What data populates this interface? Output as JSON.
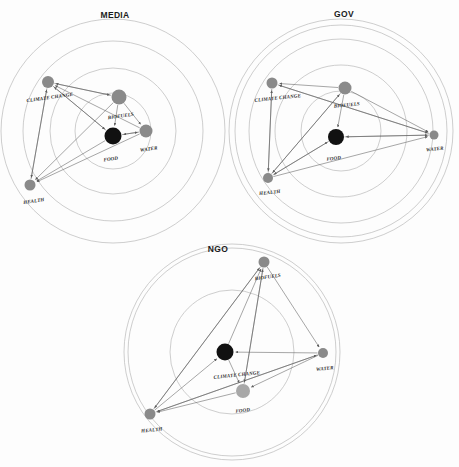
{
  "figure": {
    "background_color": "#fdfdfd",
    "node_color": "#8a8a8a",
    "node_highlight_color": "#111111",
    "ring_color": "#b9b9b9",
    "edge_color": "#5d5d5d"
  },
  "panels": [
    {
      "id": "media",
      "title": "MEDIA",
      "title_xy": [
        115,
        18
      ],
      "center": [
        113,
        131
      ],
      "rings": [
        38,
        63,
        90,
        112
      ],
      "nodes": [
        {
          "name": "climate-change",
          "label": "CLIMATE CHANGE",
          "x": 48,
          "y": 82,
          "r": 6.0,
          "color": "#8a8a8a",
          "label_dx": 2,
          "label_dy": 11,
          "label_anchor": "middle",
          "label_rot": -8
        },
        {
          "name": "biofuels",
          "label": "BIOFUELS",
          "x": 119,
          "y": 97,
          "r": 7.5,
          "color": "#8a8a8a",
          "label_dx": 2,
          "label_dy": 13,
          "label_anchor": "middle",
          "label_rot": -8
        },
        {
          "name": "water",
          "label": "WATER",
          "x": 146,
          "y": 131,
          "r": 6.5,
          "color": "#8a8a8a",
          "label_dx": 3,
          "label_dy": 13,
          "label_anchor": "middle",
          "label_rot": -8
        },
        {
          "name": "food",
          "label": "FOOD",
          "x": 113,
          "y": 136,
          "r": 8.5,
          "color": "#111111",
          "label_dx": -2,
          "label_dy": 16,
          "label_anchor": "middle",
          "label_rot": -8
        },
        {
          "name": "health",
          "label": "HEALTH",
          "x": 30,
          "y": 185,
          "r": 5.5,
          "color": "#8a8a8a",
          "label_dx": 4,
          "label_dy": 12,
          "label_anchor": "middle",
          "label_rot": -8
        }
      ],
      "edges": [
        [
          "biofuels",
          "climate-change"
        ],
        [
          "climate-change",
          "biofuels"
        ],
        [
          "water",
          "climate-change"
        ],
        [
          "food",
          "climate-change"
        ],
        [
          "climate-change",
          "health"
        ],
        [
          "biofuels",
          "health"
        ],
        [
          "water",
          "health"
        ],
        [
          "food",
          "health"
        ],
        [
          "biofuels",
          "water"
        ],
        [
          "water",
          "food"
        ],
        [
          "biofuels",
          "food"
        ],
        [
          "food",
          "water"
        ],
        [
          "climate-change",
          "food"
        ],
        [
          "health",
          "climate-change"
        ]
      ]
    },
    {
      "id": "gov",
      "title": "GOV",
      "title_xy": [
        344,
        17
      ],
      "center": [
        341,
        131
      ],
      "rings": [
        40,
        66,
        92,
        106,
        112
      ],
      "nodes": [
        {
          "name": "climate-change",
          "label": "CLIMATE CHANGE",
          "x": 272,
          "y": 83,
          "r": 5.5,
          "color": "#8a8a8a",
          "label_dx": 6,
          "label_dy": 11,
          "label_anchor": "middle",
          "label_rot": -6
        },
        {
          "name": "biofuels",
          "label": "BIOFUELS",
          "x": 345,
          "y": 88,
          "r": 6.5,
          "color": "#8a8a8a",
          "label_dx": 2,
          "label_dy": 12,
          "label_anchor": "middle",
          "label_rot": -6
        },
        {
          "name": "food",
          "label": "FOOD",
          "x": 336,
          "y": 137,
          "r": 8.0,
          "color": "#111111",
          "label_dx": -2,
          "label_dy": 15,
          "label_anchor": "middle",
          "label_rot": -6
        },
        {
          "name": "water",
          "label": "WATER",
          "x": 434,
          "y": 135,
          "r": 4.5,
          "color": "#8a8a8a",
          "label_dx": 1,
          "label_dy": 11,
          "label_anchor": "middle",
          "label_rot": -6
        },
        {
          "name": "health",
          "label": "HEALTH",
          "x": 268,
          "y": 178,
          "r": 5.0,
          "color": "#8a8a8a",
          "label_dx": 2,
          "label_dy": 11,
          "label_anchor": "middle",
          "label_rot": -6
        }
      ],
      "edges": [
        [
          "biofuels",
          "climate-change"
        ],
        [
          "water",
          "climate-change"
        ],
        [
          "health",
          "climate-change"
        ],
        [
          "climate-change",
          "health"
        ],
        [
          "biofuels",
          "water"
        ],
        [
          "biofuels",
          "food"
        ],
        [
          "food",
          "water"
        ],
        [
          "water",
          "food"
        ],
        [
          "health",
          "biofuels"
        ],
        [
          "health",
          "water"
        ],
        [
          "health",
          "food"
        ],
        [
          "food",
          "health"
        ],
        [
          "climate-change",
          "water"
        ],
        [
          "biofuels",
          "health"
        ]
      ]
    },
    {
      "id": "ngo",
      "title": "NGO",
      "title_xy": [
        218,
        252
      ],
      "center": [
        232,
        352
      ],
      "rings": [
        62,
        104,
        108
      ],
      "nodes": [
        {
          "name": "biofuels",
          "label": "BIOFUELS",
          "x": 264,
          "y": 262,
          "r": 5.5,
          "color": "#8a8a8a",
          "label_dx": 4,
          "label_dy": 11,
          "label_anchor": "middle",
          "label_rot": -8
        },
        {
          "name": "climate-change",
          "label": "CLIMATE CHANGE",
          "x": 225,
          "y": 352,
          "r": 8.5,
          "color": "#111111",
          "label_dx": 12,
          "label_dy": 16,
          "label_anchor": "middle",
          "label_rot": -6
        },
        {
          "name": "water",
          "label": "WATER",
          "x": 323,
          "y": 353,
          "r": 5.0,
          "color": "#8a8a8a",
          "label_dx": 2,
          "label_dy": 12,
          "label_anchor": "middle",
          "label_rot": -6
        },
        {
          "name": "food",
          "label": "FOOD",
          "x": 243,
          "y": 391,
          "r": 7.0,
          "color": "#a8a8a8",
          "label_dx": 0,
          "label_dy": 14,
          "label_anchor": "middle",
          "label_rot": -6
        },
        {
          "name": "health",
          "label": "HEALTH",
          "x": 150,
          "y": 414,
          "r": 5.5,
          "color": "#8a8a8a",
          "label_dx": 2,
          "label_dy": 12,
          "label_anchor": "middle",
          "label_rot": -6
        }
      ],
      "edges": [
        [
          "water",
          "climate-change"
        ],
        [
          "food",
          "biofuels"
        ],
        [
          "health",
          "biofuels"
        ],
        [
          "climate-change",
          "biofuels"
        ],
        [
          "biofuels",
          "water"
        ],
        [
          "water",
          "food"
        ],
        [
          "food",
          "health"
        ],
        [
          "health",
          "water"
        ],
        [
          "water",
          "health"
        ],
        [
          "health",
          "climate-change"
        ],
        [
          "climate-change",
          "food"
        ],
        [
          "biofuels",
          "health"
        ],
        [
          "biofuels",
          "food"
        ]
      ]
    }
  ]
}
